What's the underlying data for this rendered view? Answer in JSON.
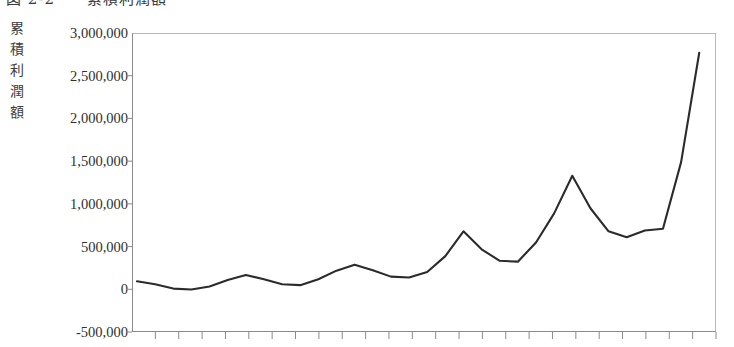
{
  "figure": {
    "caption": "図 2-2　　累積利潤額",
    "y_axis_title_chars": [
      "累",
      "積",
      "利",
      "潤",
      "額"
    ]
  },
  "chart_data": {
    "type": "line",
    "title": "図 2-2　　累積利潤額",
    "xlabel": "",
    "ylabel": "累積利潤額",
    "ylim": [
      -500000,
      3000000
    ],
    "ytick_labels": [
      "3,000,000",
      "2,500,000",
      "2,000,000",
      "1,500,000",
      "1,000,000",
      "500,000",
      "0",
      "-500,000"
    ],
    "ytick_values": [
      3000000,
      2500000,
      2000000,
      1500000,
      1000000,
      500000,
      0,
      -500000
    ],
    "grid": false,
    "legend": null,
    "x_tick_count": 25,
    "x_tick_labels": [],
    "line_color": "#2b2b2b",
    "series": [
      {
        "name": "累積利潤額",
        "x": [
          0,
          1,
          2,
          3,
          4,
          5,
          6,
          7,
          8,
          9,
          10,
          11,
          12,
          13,
          14,
          15,
          16,
          17,
          18,
          19,
          20,
          21,
          22,
          23,
          24
        ],
        "values": [
          105000,
          70000,
          20000,
          10000,
          45000,
          120000,
          180000,
          130000,
          70000,
          60000,
          130000,
          230000,
          300000,
          235000,
          160000,
          150000,
          215000,
          400000,
          690000,
          480000,
          345000,
          335000,
          560000,
          900000,
          1340000
        ]
      }
    ],
    "series_tail": {
      "note": "continuation of the same single series to the right edge",
      "x": [
        24,
        25,
        26,
        27,
        28,
        29
      ],
      "values": [
        1340000,
        960000,
        690000,
        620000,
        700000,
        720000
      ]
    },
    "final_rise": {
      "x": [
        29,
        30,
        31
      ],
      "values": [
        720000,
        1500000,
        2780000
      ]
    }
  }
}
